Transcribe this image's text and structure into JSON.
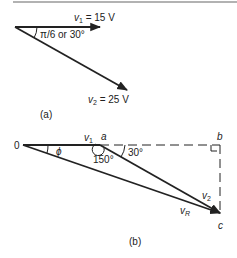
{
  "figure_a": {
    "caption": "(a)",
    "v1": {
      "symbol": "v",
      "subscript": "1",
      "value_text": " = 15 V",
      "magnitude_V": 15,
      "angle_deg": 0
    },
    "v2": {
      "symbol": "v",
      "subscript": "2",
      "value_text": " = 25 V",
      "magnitude_V": 25,
      "angle_deg": -30
    },
    "angle_label": "π/6 or 30°"
  },
  "figure_b": {
    "caption": "(b)",
    "points": {
      "origin": "0",
      "a": "a",
      "b": "b",
      "c": "c"
    },
    "v1": {
      "symbol": "v",
      "subscript": "1"
    },
    "v2": {
      "symbol": "v",
      "subscript": "2"
    },
    "vR": {
      "symbol": "v",
      "subscript": "R"
    },
    "angle_phi": "ϕ",
    "angle_150": "150°",
    "angle_30": "30°"
  },
  "colors": {
    "ink": "#222222",
    "rule": "#999999"
  }
}
